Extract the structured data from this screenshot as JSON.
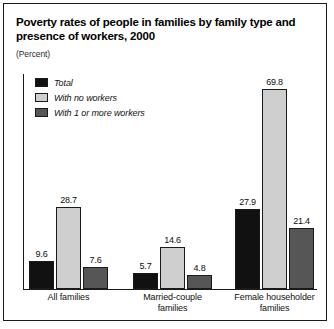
{
  "chart_data": {
    "type": "bar",
    "title": "Poverty rates of people in families by family type and presence of workers, 2000",
    "subtitle": "(Percent)",
    "xlabel": "",
    "ylabel": "",
    "ylim": [
      0,
      75
    ],
    "grid": false,
    "legend_position": "top-left",
    "categories": [
      "All families",
      "Married-couple families",
      "Female householder families"
    ],
    "category_lines": [
      [
        "All families"
      ],
      [
        "Married-couple",
        "families"
      ],
      [
        "Female householder",
        "families"
      ]
    ],
    "series": [
      {
        "name": "Total",
        "color": "#111111",
        "values": [
          9.6,
          5.7,
          27.9
        ],
        "labels": [
          "9.6",
          "5.7",
          "27.9"
        ]
      },
      {
        "name": "With no workers",
        "color": "#cfcfcf",
        "values": [
          28.7,
          14.6,
          69.8
        ],
        "labels": [
          "28.7",
          "14.6",
          "69.8"
        ]
      },
      {
        "name": "With 1 or more workers",
        "color": "#565656",
        "values": [
          7.6,
          4.8,
          21.4
        ],
        "labels": [
          "7.6",
          "4.8",
          "21.4"
        ]
      }
    ]
  },
  "colors": {
    "total": "#111111",
    "no_workers": "#cfcfcf",
    "one_or_more_workers": "#565656",
    "axis": "#1a1a1a",
    "frame": "#1a1a1a",
    "background": "#ffffff"
  }
}
